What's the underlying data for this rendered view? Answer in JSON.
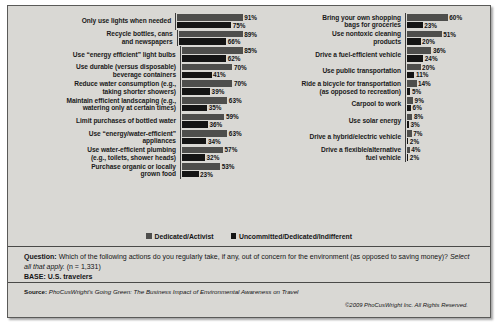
{
  "legend": {
    "items": [
      {
        "label": "Dedicated/Activist",
        "color": "#4e4e4c",
        "key": "dedicated"
      },
      {
        "label": "Uncommitted/Dedicated/Indifferent",
        "color": "#141414",
        "key": "uncommitted"
      }
    ]
  },
  "footer": {
    "question_label": "Question:",
    "question_text": "Which of the following actions do you regularly take, if any, out of concern for the environment (as opposed to saving money)?",
    "question_instruction": "Select all that apply.",
    "question_n": "(n = 1,331)",
    "base_label": "BASE:",
    "base_value": "U.S. travelers",
    "source_label": "Source:",
    "source_text": "PhoCusWright's Going Green: The Business Impact of Environmental Awareness on Travel",
    "copyright": "©2009 PhoCusWright Inc. All Rights Reserved."
  },
  "chart_data": {
    "type": "bar",
    "orientation": "horizontal",
    "title": "",
    "xlabel": "",
    "ylabel": "",
    "xlim": [
      0,
      100
    ],
    "grid": false,
    "legend_position": "bottom-center",
    "value_suffix": "%",
    "series": [
      {
        "name": "Dedicated/Activist",
        "color": "#4e4e4c"
      },
      {
        "name": "Uncommitted/Dedicated/Indifferent",
        "color": "#141414"
      }
    ],
    "panels": [
      {
        "name": "left-panel",
        "categories": [
          "Only use lights when needed",
          "Recycle bottles, cans\nand newspapers",
          "Use “energy efficient” light bulbs",
          "Use durable (versus disposable)\nbeverage containers",
          "Reduce water consumption (e.g.,\ntaking shorter showers)",
          "Maintain efficient landscaping (e.g.,\nwatering only at certain times)",
          "Limit purchases of bottled water",
          "Use “energy/water-efficient”\nappliances",
          "Use water-efficient plumbing\n(e.g., toilets, shower heads)",
          "Purchase organic or locally\ngrown food"
        ],
        "dedicated": [
          91,
          89,
          85,
          70,
          70,
          63,
          59,
          63,
          57,
          53
        ],
        "uncommitted": [
          75,
          66,
          62,
          41,
          39,
          35,
          36,
          34,
          32,
          23
        ],
        "dedicated_labels": [
          "91%",
          "89%",
          "85%",
          "70%",
          "70%",
          "63%",
          "59%",
          "63%",
          "57%",
          "53%"
        ],
        "uncommitted_labels": [
          "75%",
          "66%",
          "62%",
          "41%",
          "39%",
          "35%",
          "36%",
          "34%",
          "32%",
          "23%"
        ]
      },
      {
        "name": "right-panel",
        "categories": [
          "Bring your own shopping\nbags for groceries",
          "Use nontoxic cleaning\nproducts",
          "Drive a fuel-efficient vehicle",
          "Use public transportation",
          "Ride a bicycle for transportation\n(as opposed to recreation)",
          "Carpool to work",
          "Use solar energy",
          "Drive a hybrid/electric vehicle",
          "Drive a flexible/alternative\nfuel vehicle"
        ],
        "dedicated": [
          60,
          51,
          36,
          20,
          14,
          9,
          8,
          7,
          4
        ],
        "uncommitted": [
          23,
          20,
          24,
          11,
          5,
          6,
          3,
          2,
          2
        ],
        "dedicated_labels": [
          "60%",
          "51%",
          "36%",
          "20%",
          "14%",
          "9%",
          "8%",
          "7%",
          "4%"
        ],
        "uncommitted_labels": [
          "23%",
          "20%",
          "24%",
          "11%",
          "5%",
          "6%",
          "3%",
          "2%",
          "2%"
        ]
      }
    ]
  }
}
